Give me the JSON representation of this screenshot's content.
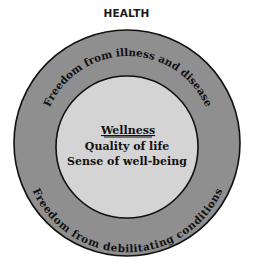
{
  "title": "HEALTH",
  "outer_ring": {
    "top_label": "Freedom from illness and disease",
    "bottom_label": "Freedom from debilitating conditions",
    "fill_color": "#8f8f8f"
  },
  "inner_circle": {
    "heading": "Wellness",
    "lines": [
      "Quality of life",
      "Sense of well-being"
    ],
    "fill_color": "#d4d4d4"
  },
  "stroke_color": "#111111"
}
